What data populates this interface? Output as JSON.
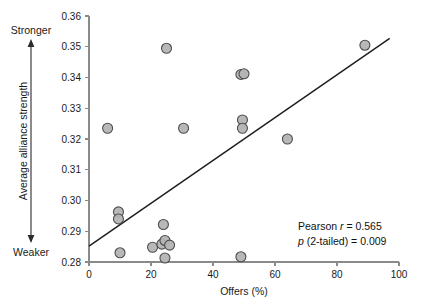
{
  "chart_data": {
    "type": "scatter",
    "title": "",
    "subtitle": "",
    "xlabel": "Offers (%)",
    "ylabel": "Average alliance strength",
    "ylabel_pole_top": "Stronger",
    "ylabel_pole_bottom": "Weaker",
    "xlim": [
      0,
      100
    ],
    "ylim": [
      0.28,
      0.36
    ],
    "xticks": [
      0,
      20,
      40,
      60,
      80,
      100
    ],
    "xtick_labels": [
      "0",
      "20",
      "40",
      "60",
      "80",
      "100"
    ],
    "yticks": [
      0.28,
      0.29,
      0.3,
      0.31,
      0.32,
      0.33,
      0.34,
      0.35,
      0.36
    ],
    "ytick_labels": [
      "0.28",
      "0.29",
      "0.30",
      "0.31",
      "0.32",
      "0.33",
      "0.34",
      "0.35",
      "0.36"
    ],
    "grid": false,
    "legend": false,
    "marker": {
      "shape": "circle",
      "fill": "#b4b4b4",
      "edge": "#4d4d4d",
      "radius_px": 5.0
    },
    "points": [
      {
        "x": 6.0,
        "y": 0.3235
      },
      {
        "x": 9.5,
        "y": 0.2963
      },
      {
        "x": 9.5,
        "y": 0.294
      },
      {
        "x": 10.0,
        "y": 0.283
      },
      {
        "x": 20.5,
        "y": 0.2848
      },
      {
        "x": 23.5,
        "y": 0.2858
      },
      {
        "x": 24.0,
        "y": 0.2922
      },
      {
        "x": 24.5,
        "y": 0.287
      },
      {
        "x": 24.5,
        "y": 0.2813
      },
      {
        "x": 25.0,
        "y": 0.3495
      },
      {
        "x": 26.0,
        "y": 0.2855
      },
      {
        "x": 30.5,
        "y": 0.3235
      },
      {
        "x": 49.0,
        "y": 0.2817
      },
      {
        "x": 49.0,
        "y": 0.341
      },
      {
        "x": 50.0,
        "y": 0.3412
      },
      {
        "x": 49.5,
        "y": 0.3262
      },
      {
        "x": 49.5,
        "y": 0.3235
      },
      {
        "x": 64.0,
        "y": 0.32
      },
      {
        "x": 89.0,
        "y": 0.3505
      }
    ],
    "trendline": {
      "type": "linear-fit",
      "x0": 0.0,
      "y0": 0.2852,
      "x1": 97.0,
      "y1": 0.3527
    },
    "annotations": [
      {
        "name": "pearson-r",
        "segments": [
          {
            "text": "Pearson ",
            "style": "normal"
          },
          {
            "text": "r",
            "style": "italic"
          },
          {
            "text": " = 0.565",
            "style": "normal"
          }
        ],
        "plain": "Pearson r = 0.565"
      },
      {
        "name": "p-value",
        "segments": [
          {
            "text": "p",
            "style": "italic"
          },
          {
            "text": " (2-tailed) = 0.009",
            "style": "normal"
          }
        ],
        "plain": "p (2-tailed) = 0.009"
      }
    ]
  },
  "colors": {
    "marker_fill": "#b4b4b4",
    "marker_edge": "#4d4d4d",
    "axis": "#8a8a8a",
    "trendline": "#1f1f1f",
    "text": "#1a1a1a",
    "background": "#ffffff"
  }
}
